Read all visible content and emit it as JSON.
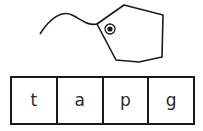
{
  "picture": {
    "subject": "tag",
    "icon": "tag-icon",
    "stroke_color": "#1a1a1a"
  },
  "letter_boxes": {
    "letters": [
      "t",
      "a",
      "p",
      "g"
    ]
  }
}
